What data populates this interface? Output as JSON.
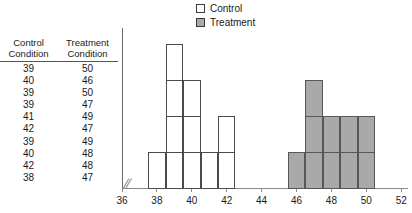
{
  "legend": {
    "items": [
      {
        "label": "Control",
        "icon": "white-square-swatch",
        "color": "#ffffff"
      },
      {
        "label": "Treatment",
        "icon": "gray-square-swatch",
        "color": "#a9a9a9"
      }
    ]
  },
  "table": {
    "columns": [
      {
        "line1": "Control",
        "line2": "Condition"
      },
      {
        "line1": "Treatment",
        "line2": "Condition"
      }
    ],
    "rows": [
      [
        "39",
        "50"
      ],
      [
        "40",
        "46"
      ],
      [
        "39",
        "50"
      ],
      [
        "39",
        "47"
      ],
      [
        "41",
        "49"
      ],
      [
        "42",
        "47"
      ],
      [
        "39",
        "49"
      ],
      [
        "40",
        "48"
      ],
      [
        "42",
        "48"
      ],
      [
        "38",
        "47"
      ]
    ]
  },
  "chart_data": {
    "type": "bar",
    "title": "",
    "xlabel": "",
    "ylabel": "",
    "xlim": [
      36,
      52
    ],
    "ylim": [
      0,
      4
    ],
    "grid": false,
    "legend_position": "top-center",
    "axis_break": "//",
    "bin_width": 1,
    "tick_labels": [
      "36",
      "38",
      "40",
      "42",
      "44",
      "46",
      "48",
      "50",
      "52"
    ],
    "ticks": [
      36,
      38,
      40,
      42,
      44,
      46,
      48,
      50,
      52
    ],
    "series": [
      {
        "name": "Control",
        "color": "#ffffff",
        "edge_color": "#4a4a4a",
        "x": [
          38,
          39,
          40,
          41,
          42
        ],
        "values": [
          1,
          4,
          3,
          1,
          2
        ]
      },
      {
        "name": "Treatment",
        "color": "#a9a9a9",
        "edge_color": "#575757",
        "x": [
          46,
          47,
          48,
          49,
          50
        ],
        "values": [
          1,
          3,
          2,
          2,
          2
        ]
      }
    ]
  }
}
